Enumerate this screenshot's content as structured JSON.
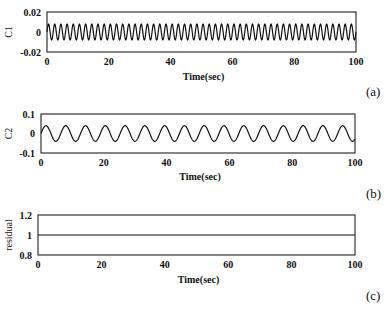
{
  "chart_data": [
    {
      "type": "line",
      "panel_label": "(a)",
      "title": "",
      "xlabel": "Time(sec)",
      "ylabel": "C1",
      "xlim": [
        0,
        100
      ],
      "ylim": [
        -0.02,
        0.02
      ],
      "xticks": [
        0,
        20,
        40,
        60,
        80,
        100
      ],
      "xtick_labels": [
        "0",
        "20",
        "40",
        "60",
        "80",
        "100"
      ],
      "yticks": [
        0.02,
        0,
        -0.02
      ],
      "ytick_labels": [
        "0.02",
        "0",
        "-0.02"
      ],
      "grid": false,
      "series": [
        {
          "name": "C1",
          "description": "sinusoidal oscillation",
          "amplitude": 0.008,
          "period_sec": 2.0,
          "offset": 0.0
        }
      ]
    },
    {
      "type": "line",
      "panel_label": "(b)",
      "title": "",
      "xlabel": "Time(sec)",
      "ylabel": "C2",
      "xlim": [
        0,
        100
      ],
      "ylim": [
        -0.1,
        0.1
      ],
      "xticks": [
        0,
        20,
        40,
        60,
        80,
        100
      ],
      "xtick_labels": [
        "0",
        "20",
        "40",
        "60",
        "80",
        "100"
      ],
      "yticks": [
        0.1,
        0,
        -0.1
      ],
      "ytick_labels": [
        "0.1",
        "0",
        "-0.1"
      ],
      "grid": false,
      "series": [
        {
          "name": "C2",
          "description": "sinusoidal oscillation",
          "amplitude": 0.04,
          "period_sec": 6.3,
          "offset": 0.0
        }
      ]
    },
    {
      "type": "line",
      "panel_label": "(c)",
      "title": "",
      "xlabel": "Time(sec)",
      "ylabel": "residual",
      "xlim": [
        0,
        100
      ],
      "ylim": [
        0.8,
        1.2
      ],
      "xticks": [
        0,
        20,
        40,
        60,
        80,
        100
      ],
      "xtick_labels": [
        "0",
        "20",
        "40",
        "60",
        "80",
        "100"
      ],
      "yticks": [
        1.2,
        1,
        0.8
      ],
      "ytick_labels": [
        "1.2",
        "1",
        "0.8"
      ],
      "grid": false,
      "series": [
        {
          "name": "residual",
          "description": "constant",
          "amplitude": 0,
          "period_sec": 0,
          "offset": 1.0
        }
      ]
    }
  ],
  "layout": {
    "panels": [
      {
        "left": 47,
        "top": 12,
        "right": 356,
        "bottom": 52,
        "xlabel_y": 80,
        "panel_label_x": 366,
        "panel_label_y": 96
      },
      {
        "left": 41,
        "top": 114,
        "right": 355,
        "bottom": 153,
        "xlabel_y": 180,
        "panel_label_x": 366,
        "panel_label_y": 198
      },
      {
        "left": 38,
        "top": 215,
        "right": 355,
        "bottom": 255,
        "xlabel_y": 283,
        "panel_label_x": 366,
        "panel_label_y": 300
      }
    ]
  }
}
